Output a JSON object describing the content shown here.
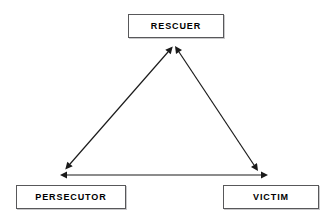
{
  "diagram": {
    "background_color": "#ffffff",
    "line_color": "#1a1a1a",
    "box_border_color": "#58585a",
    "box_shadow_color": "#c9c9cb",
    "text_color": "#000000",
    "nodes": [
      {
        "id": "rescuer",
        "label": "RESCUER",
        "position": "top-center",
        "x": 128,
        "y": 14,
        "width": 96,
        "height": 24
      },
      {
        "id": "persecutor",
        "label": "PERSECUTOR",
        "position": "bottom-left",
        "x": 16,
        "y": 185,
        "width": 110,
        "height": 24
      },
      {
        "id": "victim",
        "label": "VICTIM",
        "position": "bottom-right",
        "x": 223,
        "y": 185,
        "width": 96,
        "height": 24
      }
    ],
    "edges": [
      {
        "id": "persecutor-rescuer",
        "from": "persecutor",
        "to": "rescuer",
        "style": "double-headed-arrow",
        "x1": 68,
        "y1": 167,
        "x2": 170,
        "y2": 49
      },
      {
        "id": "rescuer-victim",
        "from": "rescuer",
        "to": "victim",
        "style": "double-headed-arrow",
        "x1": 178,
        "y1": 49,
        "x2": 256,
        "y2": 168
      },
      {
        "id": "persecutor-victim",
        "from": "persecutor",
        "to": "victim",
        "style": "double-headed-arrow",
        "x1": 64,
        "y1": 175,
        "x2": 264,
        "y2": 175
      }
    ]
  }
}
